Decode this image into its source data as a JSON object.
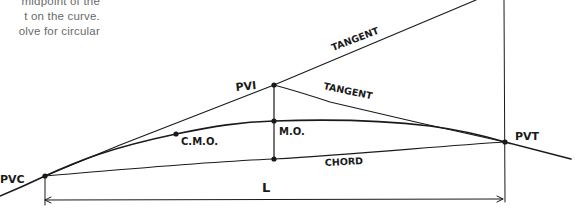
{
  "diagram": {
    "type": "vertical-curve-sketch",
    "text_fragment": {
      "lines": [
        "midpoint of the",
        "t on the curve.",
        "olve  for  circular"
      ]
    },
    "points": {
      "pvc": {
        "label": "PVC",
        "x": 45,
        "y": 176
      },
      "pvi": {
        "label": "PVI",
        "x": 274,
        "y": 85
      },
      "pvt": {
        "label": "PVT",
        "x": 505,
        "y": 142
      },
      "mo": {
        "label": "M.O.",
        "x": 274,
        "y": 121
      },
      "cmo": {
        "label": "C.M.O.",
        "x": 176,
        "y": 134
      },
      "chord_mid": {
        "x": 274,
        "y": 159
      }
    },
    "labels": {
      "tangent_upper": "TANGENT",
      "tangent_lower": "TANGENT",
      "chord": "CHORD",
      "length": "L",
      "pvc": "PVC",
      "pvi": "PVI",
      "pvt": "PVT",
      "mo": "M.O.",
      "cmo": "C.M.O."
    },
    "colors": {
      "ink": "#1a1a1a",
      "body_text": "#6a6a6a",
      "background": "#ffffff"
    }
  }
}
